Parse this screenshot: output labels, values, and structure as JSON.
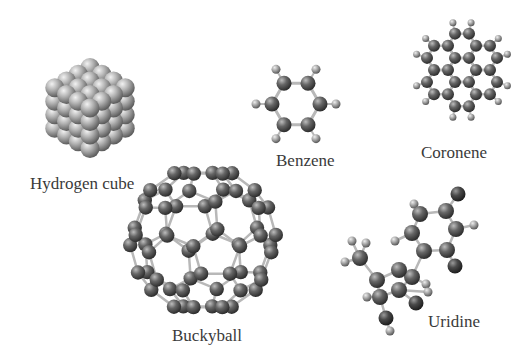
{
  "figure": {
    "background": "#ffffff",
    "atom_color_carbon": "#5a5a5a",
    "atom_color_hydrogen": "#9a9a9a",
    "atom_color_cube": "#a8a8a8",
    "bond_color": "#bdbdbd",
    "label_color": "#3a3a3a"
  },
  "molecules": [
    {
      "id": "hydrogen-cube",
      "label": "Hydrogen cube",
      "label_pos": [
        30,
        175
      ]
    },
    {
      "id": "benzene",
      "label": "Benzene",
      "label_pos": [
        276,
        152
      ]
    },
    {
      "id": "coronene",
      "label": "Coronene",
      "label_pos": [
        421,
        144
      ]
    },
    {
      "id": "buckyball",
      "label": "Buckyball",
      "label_pos": [
        172,
        327
      ]
    },
    {
      "id": "uridine",
      "label": "Uridine",
      "label_pos": [
        428,
        313
      ]
    }
  ]
}
